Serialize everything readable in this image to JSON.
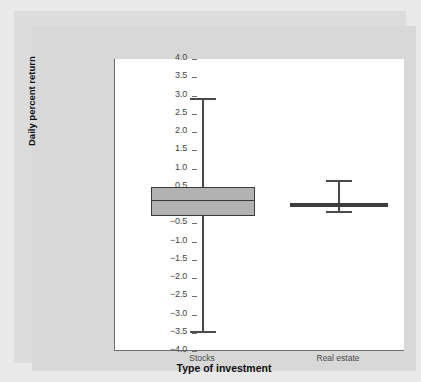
{
  "chart_data": {
    "type": "box",
    "title": "",
    "xlabel": "Type of investment",
    "ylabel": "Daily percent return",
    "categories": [
      "Stocks",
      "Real estate"
    ],
    "ylim": [
      -4.0,
      4.0
    ],
    "grid": false,
    "legend": "none",
    "yticks": [
      "4.0",
      "3.5",
      "3.0",
      "2.5",
      "2.0",
      "1.5",
      "1.0",
      "0.5",
      "0.0",
      "-0.5",
      "-1.0",
      "-1.5",
      "-2.0",
      "-2.5",
      "-3.0",
      "-3.5",
      "-4.0"
    ],
    "ytick_values": [
      4.0,
      3.5,
      3.0,
      2.5,
      2.0,
      1.5,
      1.0,
      0.5,
      0.0,
      -0.5,
      -1.0,
      -1.5,
      -2.0,
      -2.5,
      -3.0,
      -3.5,
      -4.0
    ],
    "boxes": [
      {
        "category": "Stocks",
        "whisker_high": 2.92,
        "q3": 0.5,
        "median": 0.12,
        "q1": -0.3,
        "whisker_low": -3.46
      },
      {
        "category": "Real estate",
        "whisker_high": 0.68,
        "q3": 0.03,
        "median": 0.0,
        "q1": -0.03,
        "whisker_low": -0.17
      }
    ]
  },
  "colors": {
    "page_background": "#e9e9e9",
    "card_background": "#d8d8d8",
    "plot_background": "#ffffff",
    "box_fill": "#b2b2b2",
    "box_stroke": "#3a3a3a",
    "whisker": "#4a4a4a",
    "axis": "#6e6e6e",
    "tick_text": "#444444",
    "label_text": "#111111"
  }
}
